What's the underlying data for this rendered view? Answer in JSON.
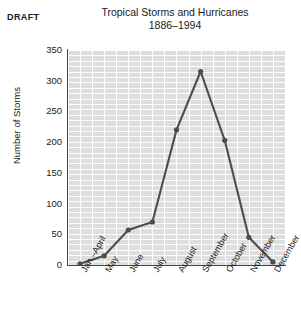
{
  "draft_label": "DRAFT",
  "chart_data": {
    "type": "line",
    "title": "Tropical Storms and Hurricanes",
    "subtitle": "1886–1994",
    "xlabel": "",
    "ylabel": "Number of Storms",
    "ylim": [
      0,
      350
    ],
    "yticks": [
      350,
      300,
      250,
      200,
      150,
      100,
      50,
      0
    ],
    "ytick_labels": [
      "350",
      "300",
      "250",
      "200",
      "150",
      "100",
      "50",
      "0"
    ],
    "categories": [
      "Jan.–April",
      "May",
      "June",
      "July",
      "August",
      "September",
      "October",
      "November",
      "December"
    ],
    "values": [
      2,
      15,
      57,
      70,
      220,
      315,
      203,
      45,
      5
    ],
    "grid": true,
    "legend": null,
    "line_color": "#4d4d4d",
    "marker_color": "#4d4d4d",
    "plot_bg": "#dedede"
  }
}
